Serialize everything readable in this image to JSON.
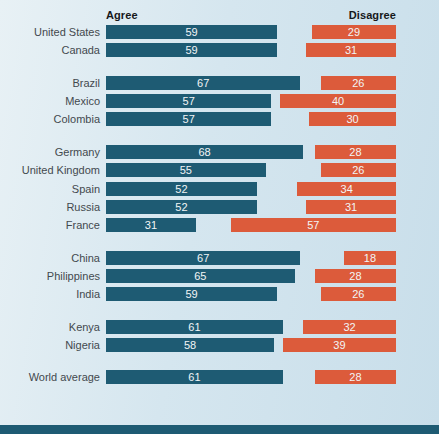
{
  "chart_data": {
    "type": "bar",
    "orientation": "horizontal-paired",
    "title": "",
    "xlim": [
      0,
      100
    ],
    "grid": false,
    "legend_position": "column-headers",
    "column_headers": {
      "agree": "Agree",
      "disagree": "Disagree"
    },
    "series": [
      {
        "name": "Agree"
      },
      {
        "name": "Disagree"
      }
    ],
    "colors": {
      "agree": "#1e5b73",
      "disagree": "#dc5b3b",
      "background": "#d5e6ef",
      "footer_band": "#1e5b73",
      "label_text": "#43494e",
      "value_text": "#f2f5f6"
    },
    "groups": [
      {
        "rows": [
          {
            "label": "United States",
            "agree": 59,
            "disagree": 29
          },
          {
            "label": "Canada",
            "agree": 59,
            "disagree": 31
          }
        ]
      },
      {
        "rows": [
          {
            "label": "Brazil",
            "agree": 67,
            "disagree": 26
          },
          {
            "label": "Mexico",
            "agree": 57,
            "disagree": 40
          },
          {
            "label": "Colombia",
            "agree": 57,
            "disagree": 30
          }
        ]
      },
      {
        "rows": [
          {
            "label": "Germany",
            "agree": 68,
            "disagree": 28
          },
          {
            "label": "United Kingdom",
            "agree": 55,
            "disagree": 26
          },
          {
            "label": "Spain",
            "agree": 52,
            "disagree": 34
          },
          {
            "label": "Russia",
            "agree": 52,
            "disagree": 31
          },
          {
            "label": "France",
            "agree": 31,
            "disagree": 57
          }
        ]
      },
      {
        "rows": [
          {
            "label": "China",
            "agree": 67,
            "disagree": 18
          },
          {
            "label": "Philippines",
            "agree": 65,
            "disagree": 28
          },
          {
            "label": "India",
            "agree": 59,
            "disagree": 26
          }
        ]
      },
      {
        "rows": [
          {
            "label": "Kenya",
            "agree": 61,
            "disagree": 32
          },
          {
            "label": "Nigeria",
            "agree": 58,
            "disagree": 39
          }
        ]
      },
      {
        "rows": [
          {
            "label": "World average",
            "agree": 61,
            "disagree": 28
          }
        ]
      }
    ]
  }
}
